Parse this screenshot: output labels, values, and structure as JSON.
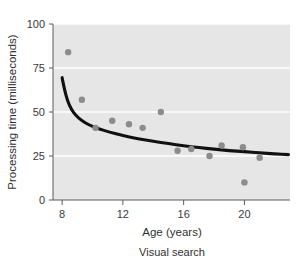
{
  "chart_data": {
    "type": "scatter",
    "title": "",
    "caption": "Visual search",
    "xlabel": "Age (years)",
    "ylabel": "Processing time (milliseconds)",
    "xlim": [
      7.4,
      23.0
    ],
    "ylim": [
      0,
      100
    ],
    "xticks": [
      8,
      12,
      16,
      20
    ],
    "xtick_labels": [
      "8",
      "12",
      "16",
      "20"
    ],
    "yticks": [
      0,
      25,
      50,
      75,
      100
    ],
    "ytick_labels": [
      "0",
      "25",
      "50",
      "75",
      "100"
    ],
    "grid": "horizontal-white-on-gray",
    "legend": "none",
    "plot_background": "#e6e6e6",
    "point_color": "#8c8c8c",
    "line_color": "#111111",
    "points": [
      {
        "x": 8.4,
        "y": 84
      },
      {
        "x": 9.3,
        "y": 57
      },
      {
        "x": 10.2,
        "y": 41
      },
      {
        "x": 11.3,
        "y": 45
      },
      {
        "x": 12.4,
        "y": 43
      },
      {
        "x": 13.3,
        "y": 41
      },
      {
        "x": 14.5,
        "y": 50
      },
      {
        "x": 15.6,
        "y": 28
      },
      {
        "x": 16.5,
        "y": 29
      },
      {
        "x": 17.7,
        "y": 25
      },
      {
        "x": 18.5,
        "y": 31
      },
      {
        "x": 20.0,
        "y": 10
      },
      {
        "x": 19.9,
        "y": 30
      },
      {
        "x": 21.0,
        "y": 24
      }
    ],
    "fit_curve": {
      "description": "decaying power/hyperbolic fit",
      "points": [
        {
          "x": 8.0,
          "y": 69.5
        },
        {
          "x": 8.15,
          "y": 63.0
        },
        {
          "x": 8.35,
          "y": 56.5
        },
        {
          "x": 8.6,
          "y": 51.5
        },
        {
          "x": 8.9,
          "y": 48.0
        },
        {
          "x": 9.3,
          "y": 45.0
        },
        {
          "x": 9.8,
          "y": 42.5
        },
        {
          "x": 10.4,
          "y": 40.5
        },
        {
          "x": 11.1,
          "y": 38.6
        },
        {
          "x": 12.0,
          "y": 36.6
        },
        {
          "x": 13.0,
          "y": 34.8
        },
        {
          "x": 14.0,
          "y": 33.3
        },
        {
          "x": 15.0,
          "y": 32.0
        },
        {
          "x": 16.0,
          "y": 30.8
        },
        {
          "x": 17.0,
          "y": 29.8
        },
        {
          "x": 18.0,
          "y": 28.9
        },
        {
          "x": 19.0,
          "y": 28.1
        },
        {
          "x": 20.0,
          "y": 27.4
        },
        {
          "x": 21.0,
          "y": 26.8
        },
        {
          "x": 22.0,
          "y": 26.2
        },
        {
          "x": 22.9,
          "y": 25.8
        }
      ]
    }
  }
}
